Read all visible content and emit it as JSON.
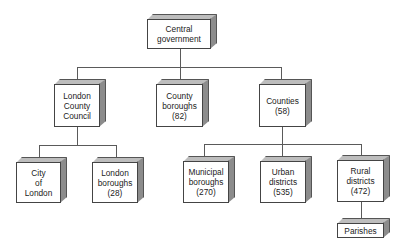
{
  "diagram": {
    "nodes": [
      {
        "id": "central",
        "lines": "Central\ngovernment",
        "x": 147,
        "y": 19,
        "w": 64,
        "h": 30
      },
      {
        "id": "lcc",
        "lines": "London\nCounty\nCouncil",
        "x": 54,
        "y": 84,
        "w": 46,
        "h": 43
      },
      {
        "id": "county-boroughs",
        "lines": "County\nboroughs\n(82)",
        "x": 156,
        "y": 84,
        "w": 47,
        "h": 43
      },
      {
        "id": "counties",
        "lines": "Counties\n(58)",
        "x": 259,
        "y": 84,
        "w": 47,
        "h": 43
      },
      {
        "id": "city-of-london",
        "lines": "City\nof\nLondon",
        "x": 16,
        "y": 162,
        "w": 45,
        "h": 41
      },
      {
        "id": "london-boroughs",
        "lines": "London\nboroughs\n(28)",
        "x": 92,
        "y": 162,
        "w": 46,
        "h": 41
      },
      {
        "id": "municipal-boroughs",
        "lines": "Municipal\nboroughs\n(270)",
        "x": 183,
        "y": 161,
        "w": 46,
        "h": 42
      },
      {
        "id": "urban-districts",
        "lines": "Urban\ndistricts\n(535)",
        "x": 260,
        "y": 161,
        "w": 46,
        "h": 42
      },
      {
        "id": "rural-districts",
        "lines": "Rural\ndistricts\n(472)",
        "x": 337,
        "y": 160,
        "w": 47,
        "h": 42
      },
      {
        "id": "parishes",
        "lines": "Parishes",
        "x": 337,
        "y": 223,
        "w": 47,
        "h": 15
      }
    ],
    "edges": [
      [
        "central",
        "lcc"
      ],
      [
        "central",
        "county-boroughs"
      ],
      [
        "central",
        "counties"
      ],
      [
        "lcc",
        "city-of-london"
      ],
      [
        "lcc",
        "london-boroughs"
      ],
      [
        "counties",
        "municipal-boroughs"
      ],
      [
        "counties",
        "urban-districts"
      ],
      [
        "counties",
        "rural-districts"
      ],
      [
        "rural-districts",
        "parishes"
      ]
    ],
    "colors": {
      "line": "#5a5a5a",
      "face": "#ffffff",
      "top": "#bdbdbd",
      "side": "#8c8c8c"
    }
  }
}
